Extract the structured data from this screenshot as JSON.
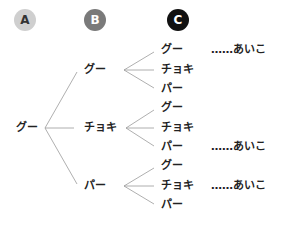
{
  "columns": [
    {
      "label": "A",
      "bg": "#cfcfcf",
      "fg": "#333333"
    },
    {
      "label": "B",
      "bg": "#7a7a7a",
      "fg": "#ffffff"
    },
    {
      "label": "C",
      "bg": "#111111",
      "fg": "#ffffff"
    }
  ],
  "root": {
    "label": "グー"
  },
  "level1": [
    {
      "label": "グー"
    },
    {
      "label": "チョキ"
    },
    {
      "label": "パー"
    }
  ],
  "level2": [
    {
      "label": "グー",
      "note": "……あいこ"
    },
    {
      "label": "チョキ",
      "note": ""
    },
    {
      "label": "パー",
      "note": ""
    },
    {
      "label": "グー",
      "note": ""
    },
    {
      "label": "チョキ",
      "note": ""
    },
    {
      "label": "パー",
      "note": "……あいこ"
    },
    {
      "label": "グー",
      "note": ""
    },
    {
      "label": "チョキ",
      "note": "……あいこ"
    },
    {
      "label": "パー",
      "note": ""
    }
  ],
  "colors": {
    "line": "#9a9a9a",
    "text": "#222222"
  }
}
